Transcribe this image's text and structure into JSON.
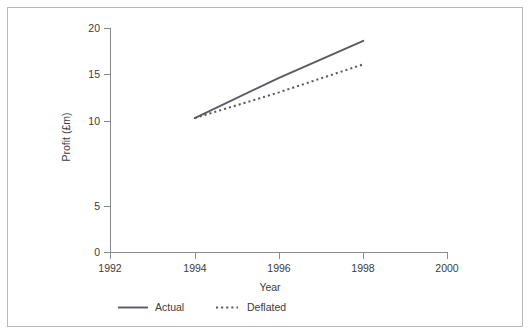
{
  "chart_data": {
    "type": "line",
    "title": "",
    "xlabel": "Year",
    "ylabel": "Profit (£m)",
    "xlim": [
      1992,
      2000
    ],
    "ylim": [
      0,
      20
    ],
    "xticks": [
      1992,
      1994,
      1996,
      1998,
      2000
    ],
    "xtick_labels": [
      "1992",
      "1994",
      "1996",
      "1998",
      "2000"
    ],
    "yticks": [
      0,
      5,
      10,
      15,
      20
    ],
    "ytick_labels": [
      "0",
      "5",
      "10",
      "15",
      "20"
    ],
    "grid": false,
    "legend_position": "below-axes",
    "x": [
      1994,
      1996,
      1998
    ],
    "series": [
      {
        "name": "Actual",
        "style": "solid",
        "color": "#5a5a62",
        "values": [
          12.0,
          15.6,
          18.9
        ]
      },
      {
        "name": "Deflated",
        "style": "dotted",
        "color": "#5a5a62",
        "values": [
          12.0,
          14.3,
          16.8
        ]
      }
    ]
  },
  "axes": {
    "y_axis_title": "Profit (£m)",
    "x_axis_title": "Year",
    "y_tick_0": "0",
    "y_tick_1": "5",
    "y_tick_2": "10",
    "y_tick_3": "15",
    "y_tick_4": "20",
    "x_tick_0": "1992",
    "x_tick_1": "1994",
    "x_tick_2": "1996",
    "x_tick_3": "1998",
    "x_tick_4": "2000"
  },
  "legend": {
    "entries": [
      {
        "label": "Actual",
        "style": "solid"
      },
      {
        "label": "Deflated",
        "style": "dotted"
      }
    ],
    "actual_label": "Actual",
    "deflated_label": "Deflated"
  }
}
